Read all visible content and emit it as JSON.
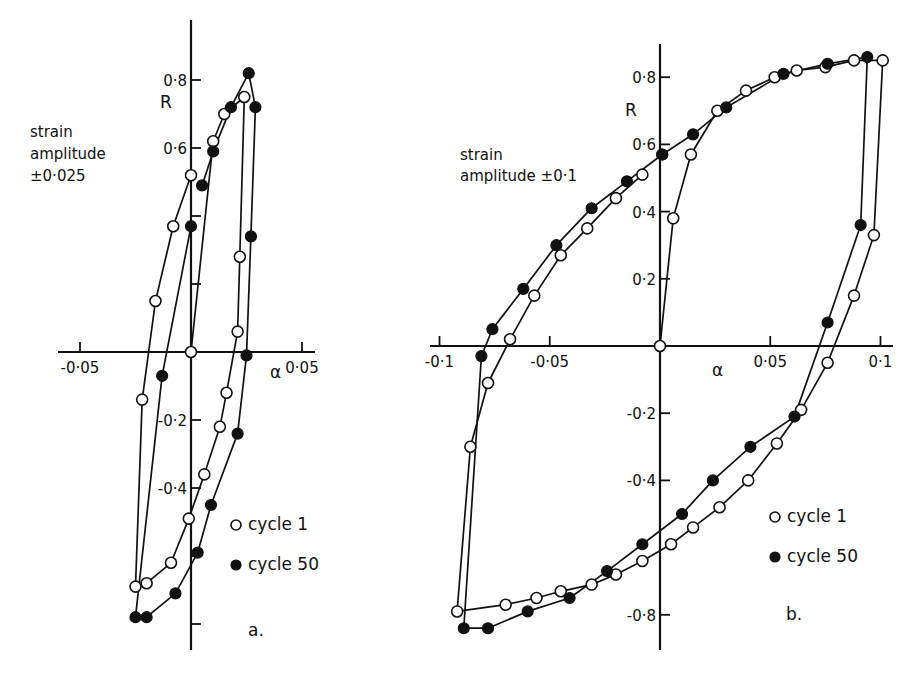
{
  "chart_data": [
    {
      "panel": "a.",
      "type": "line",
      "xlabel": "α",
      "ylabel": "R",
      "annotation": [
        "strain",
        "amplitude",
        "±0·025"
      ],
      "xlim": [
        -0.05,
        0.05
      ],
      "ylim": [
        -0.8,
        0.9
      ],
      "x_ticks": [
        {
          "v": -0.05,
          "label": "-0·05"
        },
        {
          "v": 0.05,
          "label": "0·05"
        }
      ],
      "y_ticks": [
        {
          "v": 0.8,
          "label": "0·8"
        },
        {
          "v": 0.6,
          "label": "0·6"
        },
        {
          "v": 0.4,
          "label": ""
        },
        {
          "v": 0.2,
          "label": ""
        },
        {
          "v": -0.2,
          "label": "-0·2"
        },
        {
          "v": -0.4,
          "label": "-0·4"
        },
        {
          "v": -0.6,
          "label": ""
        },
        {
          "v": -0.8,
          "label": ""
        }
      ],
      "legend": [
        {
          "marker": "open",
          "label": "cycle 1"
        },
        {
          "marker": "filled",
          "label": "cycle 50"
        }
      ],
      "series": [
        {
          "name": "cycle 1",
          "marker": "open",
          "points": [
            [
              0.0,
              0.0
            ],
            [
              0.01,
              0.62
            ],
            [
              0.015,
              0.7
            ],
            [
              0.024,
              0.75
            ],
            [
              0.022,
              0.28
            ],
            [
              0.021,
              0.06
            ],
            [
              0.016,
              -0.12
            ],
            [
              0.013,
              -0.22
            ],
            [
              0.006,
              -0.36
            ],
            [
              -0.001,
              -0.49
            ],
            [
              -0.009,
              -0.62
            ],
            [
              -0.02,
              -0.68
            ],
            [
              -0.025,
              -0.69
            ],
            [
              -0.022,
              -0.14
            ],
            [
              -0.016,
              0.15
            ],
            [
              -0.008,
              0.37
            ],
            [
              0.0,
              0.52
            ]
          ]
        },
        {
          "name": "cycle 50",
          "marker": "filled",
          "points": [
            [
              0.005,
              0.49
            ],
            [
              0.01,
              0.59
            ],
            [
              0.018,
              0.72
            ],
            [
              0.026,
              0.82
            ],
            [
              0.029,
              0.72
            ],
            [
              0.027,
              0.34
            ],
            [
              0.025,
              -0.01
            ],
            [
              0.021,
              -0.24
            ],
            [
              0.009,
              -0.45
            ],
            [
              0.003,
              -0.59
            ],
            [
              -0.007,
              -0.71
            ],
            [
              -0.02,
              -0.78
            ],
            [
              -0.025,
              -0.78
            ],
            [
              -0.013,
              -0.07
            ],
            [
              0.0,
              0.37
            ]
          ]
        }
      ]
    },
    {
      "panel": "b.",
      "type": "line",
      "xlabel": "α",
      "ylabel": "R",
      "annotation": [
        "strain",
        "amplitude ±0·1"
      ],
      "xlim": [
        -0.1,
        0.1
      ],
      "ylim": [
        -0.8,
        0.9
      ],
      "x_ticks": [
        {
          "v": -0.1,
          "label": "-0·1"
        },
        {
          "v": -0.05,
          "label": "-0·05"
        },
        {
          "v": 0.05,
          "label": "0·05"
        },
        {
          "v": 0.1,
          "label": "0·1"
        }
      ],
      "y_ticks": [
        {
          "v": 0.8,
          "label": "0·8"
        },
        {
          "v": 0.6,
          "label": "0·6"
        },
        {
          "v": 0.4,
          "label": "0·4"
        },
        {
          "v": 0.2,
          "label": "0·2"
        },
        {
          "v": -0.2,
          "label": "-0·2"
        },
        {
          "v": -0.4,
          "label": "-0·4"
        },
        {
          "v": -0.8,
          "label": "-0·8"
        }
      ],
      "legend": [
        {
          "marker": "open",
          "label": "cycle 1"
        },
        {
          "marker": "filled",
          "label": "cycle 50"
        }
      ],
      "series": [
        {
          "name": "cycle 1",
          "marker": "open",
          "points": [
            [
              0.0,
              0.0
            ],
            [
              0.006,
              0.38
            ],
            [
              0.014,
              0.57
            ],
            [
              0.026,
              0.7
            ],
            [
              0.039,
              0.76
            ],
            [
              0.052,
              0.8
            ],
            [
              0.062,
              0.82
            ],
            [
              0.075,
              0.83
            ],
            [
              0.088,
              0.85
            ],
            [
              0.101,
              0.85
            ],
            [
              0.097,
              0.33
            ],
            [
              0.088,
              0.15
            ],
            [
              0.076,
              -0.05
            ],
            [
              0.064,
              -0.19
            ],
            [
              0.053,
              -0.29
            ],
            [
              0.04,
              -0.4
            ],
            [
              0.027,
              -0.48
            ],
            [
              0.015,
              -0.54
            ],
            [
              0.005,
              -0.59
            ],
            [
              -0.008,
              -0.64
            ],
            [
              -0.02,
              -0.68
            ],
            [
              -0.031,
              -0.71
            ],
            [
              -0.045,
              -0.73
            ],
            [
              -0.056,
              -0.75
            ],
            [
              -0.07,
              -0.77
            ],
            [
              -0.092,
              -0.79
            ],
            [
              -0.086,
              -0.3
            ],
            [
              -0.078,
              -0.11
            ],
            [
              -0.068,
              0.02
            ],
            [
              -0.057,
              0.15
            ],
            [
              -0.045,
              0.27
            ],
            [
              -0.033,
              0.35
            ],
            [
              -0.02,
              0.44
            ],
            [
              -0.008,
              0.51
            ]
          ]
        },
        {
          "name": "cycle 50",
          "marker": "filled",
          "points": [
            [
              0.001,
              0.57
            ],
            [
              0.015,
              0.63
            ],
            [
              0.03,
              0.71
            ],
            [
              0.056,
              0.81
            ],
            [
              0.076,
              0.84
            ],
            [
              0.094,
              0.86
            ],
            [
              0.091,
              0.36
            ],
            [
              0.076,
              0.07
            ],
            [
              0.061,
              -0.21
            ],
            [
              0.041,
              -0.3
            ],
            [
              0.024,
              -0.4
            ],
            [
              0.01,
              -0.5
            ],
            [
              -0.008,
              -0.59
            ],
            [
              -0.024,
              -0.67
            ],
            [
              -0.041,
              -0.75
            ],
            [
              -0.06,
              -0.79
            ],
            [
              -0.078,
              -0.84
            ],
            [
              -0.089,
              -0.84
            ],
            [
              -0.081,
              -0.03
            ],
            [
              -0.076,
              0.05
            ],
            [
              -0.062,
              0.17
            ],
            [
              -0.047,
              0.3
            ],
            [
              -0.031,
              0.41
            ],
            [
              -0.015,
              0.49
            ],
            [
              0.001,
              0.57
            ]
          ]
        }
      ]
    }
  ],
  "layout": [
    {
      "x0": 191,
      "y0": 352,
      "sx": 2220,
      "sy": 340,
      "xaxis": [
        58,
        315
      ],
      "yaxis": [
        20,
        650
      ],
      "xlabel_pos": [
        270,
        378
      ],
      "ylabel_pos": [
        160,
        108
      ],
      "annotation_pos": [
        30,
        137
      ],
      "annotation_dy": 22,
      "legend_pos": [
        236,
        530
      ],
      "legend_dy": 40,
      "panel_pos": [
        248,
        636
      ]
    },
    {
      "x0": 660,
      "y0": 346,
      "sx": 2205,
      "sy": 336,
      "xaxis": [
        430,
        893
      ],
      "yaxis": [
        44,
        650
      ],
      "xlabel_pos": [
        712,
        376
      ],
      "ylabel_pos": [
        625,
        116
      ],
      "annotation_pos": [
        460,
        160
      ],
      "annotation_dy": 21,
      "legend_pos": [
        775,
        522
      ],
      "legend_dy": 40,
      "panel_pos": [
        786,
        620
      ]
    }
  ]
}
